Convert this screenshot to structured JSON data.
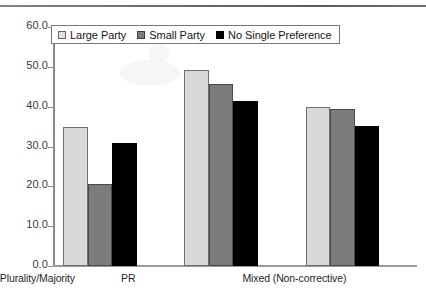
{
  "chart_data": {
    "type": "bar",
    "title": "",
    "subtitle": "",
    "xlabel": "",
    "ylabel": "",
    "categories": [
      "Plurality/Majority",
      "PR",
      "Mixed (Non-corrective)"
    ],
    "series": [
      {
        "name": "Large Party",
        "color": "#d8d8d8",
        "values": [
          34.9,
          49.2,
          40.0
        ]
      },
      {
        "name": "Small Party",
        "color": "#7c7c7c",
        "values": [
          20.5,
          45.6,
          39.4
        ]
      },
      {
        "name": "No Single Preference",
        "color": "#000000",
        "values": [
          30.8,
          41.5,
          35.2
        ]
      }
    ],
    "ylim": [
      0.0,
      60.0
    ],
    "ytick_step": 10.0,
    "ytick_labels": [
      "60.0",
      "50.0",
      "40.0",
      "30.0",
      "20.0",
      "10.0",
      "0.0"
    ],
    "ytick_values": [
      60.0,
      50.0,
      40.0,
      30.0,
      20.0,
      10.0,
      0.0
    ],
    "grid": false,
    "legend_position": "top-left-inside",
    "axis_color": "#8a8a8a",
    "background": "#ffffff"
  },
  "legend": {
    "entries": [
      {
        "label": "Large Party",
        "swatch": "light-gray-swatch"
      },
      {
        "label": "Small Party",
        "swatch": "dark-gray-swatch"
      },
      {
        "label": "No Single Preference",
        "swatch": "black-swatch"
      }
    ]
  }
}
